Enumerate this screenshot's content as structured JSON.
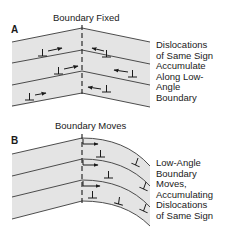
{
  "panel_a": {
    "label": "A",
    "title": "Boundary Fixed",
    "caption_lines": [
      "Dislocations",
      "of Same Sign",
      "Accumulate",
      "Along Low-",
      "Angle",
      "Boundary"
    ]
  },
  "panel_b": {
    "label": "B",
    "title": "Boundary Moves",
    "caption_lines": [
      "Low-Angle",
      "Boundary",
      "Moves,",
      "Accumulating",
      "Dislocations",
      "of Same Sign"
    ]
  },
  "colors": {
    "band_fill": "#e4e4e4",
    "line": "#3a3a3a",
    "text": "#1a1a1a"
  }
}
